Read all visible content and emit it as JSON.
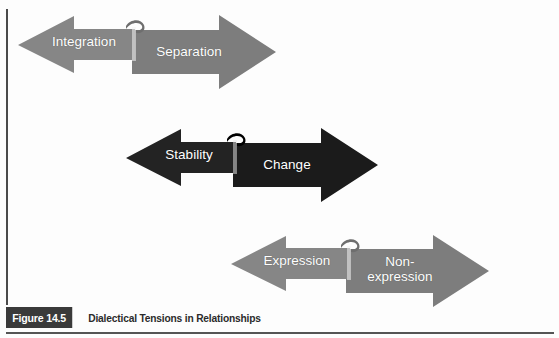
{
  "figure": {
    "caption_number": "Figure 14.5",
    "caption_title": "Dialectical Tensions in Relationships",
    "background_color": "#fdfdfd",
    "gray_color": "#808080",
    "dark_color": "#1d1d1d",
    "label_color": "#ffffff",
    "caption_box_color": "#3a3a3a"
  },
  "pairs": [
    {
      "id": "integration-separation",
      "color": "#808080",
      "left_label": "Integration",
      "right_label": "Separation"
    },
    {
      "id": "stability-change",
      "color": "#1d1d1d",
      "left_label": "Stability",
      "right_label": "Change"
    },
    {
      "id": "expression-nonexpression",
      "color": "#808080",
      "left_label": "Expression",
      "right_label": "Non-\nexpression"
    }
  ]
}
